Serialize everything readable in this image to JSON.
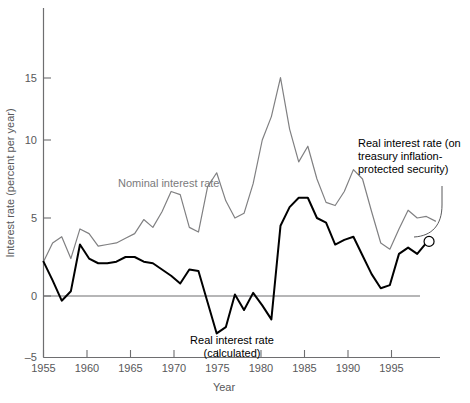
{
  "chart_data": {
    "type": "line",
    "title": "",
    "xlabel": "Year",
    "ylabel": "Interest rate (percent per year)",
    "xlim": [
      1955,
      1998.5
    ],
    "ylim": [
      -5,
      16.5
    ],
    "xticks": [
      1955,
      1960,
      1965,
      1970,
      1975,
      1980,
      1985,
      1990,
      1995
    ],
    "yticks": [
      -5,
      0,
      5,
      10,
      15
    ],
    "grid": false,
    "legend_position": "inline-annotations",
    "zero_reference_line": 0,
    "annotations": [
      {
        "name": "nominal-series-label",
        "text": "Nominal interest rate",
        "x": 1963.0,
        "y": 7.9,
        "color": "#7a7a7c"
      },
      {
        "name": "real-series-label",
        "text": "Real interest rate\n(calculated)",
        "x": 1972.5,
        "y": -3.6,
        "color": "#000000"
      },
      {
        "name": "tips-series-label",
        "text": "Real interest rate (on\ntreasury inflation-\nprotected security)",
        "x": 1992.0,
        "y": 9.6,
        "color": "#000000"
      }
    ],
    "series": [
      {
        "name": "Nominal interest rate",
        "color": "#808082",
        "label": "Nominal interest rate",
        "x": [
          1955,
          1956,
          1957,
          1958,
          1959,
          1960,
          1961,
          1962,
          1963,
          1964,
          1965,
          1966,
          1967,
          1968,
          1969,
          1970,
          1971,
          1972,
          1973,
          1974,
          1975,
          1976,
          1977,
          1978,
          1979,
          1980,
          1981,
          1982,
          1983,
          1984,
          1985,
          1986,
          1987,
          1988,
          1989,
          1990,
          1991,
          1992,
          1993,
          1994,
          1995,
          1996,
          1997,
          1998
        ],
        "values": [
          2.2,
          3.4,
          3.8,
          2.4,
          4.3,
          4.0,
          3.2,
          3.3,
          3.4,
          3.7,
          4.0,
          4.9,
          4.4,
          5.4,
          6.7,
          6.5,
          4.4,
          4.1,
          7.0,
          7.9,
          6.1,
          5.0,
          5.3,
          7.2,
          10.0,
          11.5,
          14.0,
          10.7,
          8.6,
          9.6,
          7.5,
          6.0,
          5.8,
          6.7,
          8.1,
          7.5,
          5.4,
          3.4,
          3.0,
          4.3,
          5.5,
          5.0,
          5.1,
          4.8
        ]
      },
      {
        "name": "Real interest rate (calculated)",
        "color": "#000000",
        "label": "Real interest rate (calculated)",
        "x": [
          1955,
          1956,
          1957,
          1958,
          1959,
          1960,
          1961,
          1962,
          1963,
          1964,
          1965,
          1966,
          1967,
          1968,
          1969,
          1970,
          1971,
          1972,
          1973,
          1974,
          1975,
          1976,
          1977,
          1978,
          1979,
          1980,
          1981,
          1982,
          1983,
          1984,
          1985,
          1986,
          1987,
          1988,
          1989,
          1990,
          1991,
          1992,
          1993,
          1994,
          1995,
          1996,
          1997
        ],
        "values": [
          2.2,
          1.0,
          -0.3,
          0.3,
          3.3,
          2.4,
          2.1,
          2.1,
          2.2,
          2.5,
          2.5,
          2.2,
          2.1,
          1.7,
          1.3,
          0.8,
          1.7,
          1.6,
          -0.4,
          -2.4,
          -2.0,
          0.1,
          -0.9,
          0.2,
          -0.6,
          -1.5,
          4.5,
          5.7,
          6.3,
          6.3,
          5.0,
          4.7,
          3.3,
          3.6,
          3.8,
          2.6,
          1.4,
          0.5,
          0.7,
          2.7,
          3.1,
          2.7,
          3.4
        ]
      },
      {
        "name": "Real interest rate (TIPS)",
        "color": "#000000",
        "label": "Real interest rate (on treasury inflation-protected security)",
        "marker": "open-circle",
        "x": [
          1997.3
        ],
        "values": [
          3.5
        ]
      }
    ]
  },
  "axes": {
    "x_tick_labels": [
      "1955",
      "1960",
      "1965",
      "1970",
      "1975",
      "1980",
      "1985",
      "1990",
      "1995"
    ],
    "y_tick_labels": [
      "15",
      "10",
      "5",
      "0",
      "–5"
    ],
    "x_axis_title": "Year",
    "y_axis_title": "Interest rate (percent per year)"
  },
  "labels": {
    "nominal": "Nominal interest rate",
    "real_line1": "Real interest rate",
    "real_line2": "(calculated)",
    "tips_line1": "Real interest rate (on",
    "tips_line2": "treasury inflation-",
    "tips_line3": "protected security)"
  },
  "colors": {
    "nominal_line": "#808082",
    "real_line": "#000000",
    "axis": "#6e6e70",
    "text": "#58585a",
    "background": "#ffffff"
  }
}
